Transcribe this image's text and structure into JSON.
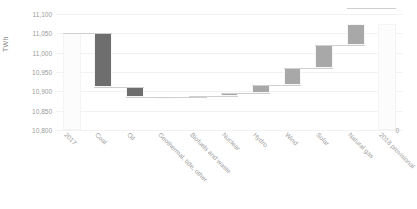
{
  "chart_data": {
    "type": "bar",
    "subtype": "waterfall",
    "title": "",
    "xlabel": "",
    "ylabel": "TWh",
    "ylim": [
      10800,
      11100
    ],
    "yticks": [
      10800,
      10850,
      10900,
      10950,
      11000,
      11050,
      11100
    ],
    "ytick_labels": [
      "10,800",
      "10,850",
      "10,900",
      "10,950",
      "11,000",
      "11,050",
      "11,100"
    ],
    "axis_break_label": "0",
    "grid": true,
    "legend": "none",
    "categories": [
      "2017",
      "Coal",
      "Oil",
      "Geothermal, tide, other",
      "Biofuels and waste",
      "Nuclear",
      "Hydro",
      "Wind",
      "Solar",
      "Natural gas",
      "2018 provisional"
    ],
    "kinds": [
      "total",
      "decrease",
      "decrease",
      "increase",
      "increase",
      "increase",
      "increase",
      "increase",
      "increase",
      "increase",
      "total"
    ],
    "values": [
      11050,
      -140,
      -25,
      1,
      2,
      8,
      20,
      45,
      60,
      95,
      11075
    ],
    "cumulative": [
      11050,
      10910,
      10885,
      10886,
      10888,
      10896,
      10916,
      10961,
      11021,
      11116,
      11075
    ],
    "bar_start": [
      10800,
      10910,
      10885,
      10885,
      10886,
      10888,
      10896,
      10916,
      10961,
      11021,
      10800
    ],
    "bar_end": [
      11050,
      11050,
      10910,
      10886,
      10888,
      10896,
      10916,
      10961,
      11021,
      11075,
      11075
    ],
    "colors": {
      "decrease": "#6e6e6e",
      "increase": "#a8a8a8",
      "total": "#fcfcfc",
      "connector": "#cfcfcf",
      "gridline": "#f2f2f2",
      "tick_text": "#9a9a9a"
    }
  }
}
